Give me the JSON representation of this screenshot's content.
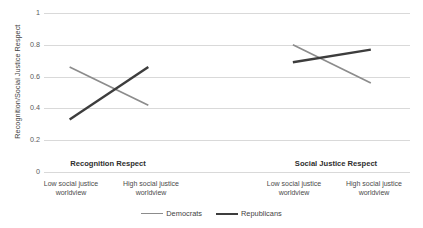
{
  "chart_data": {
    "type": "line",
    "title": "",
    "xlabel": "",
    "ylabel": "Recognition/Social Justice Respect",
    "ylim": [
      0,
      1
    ],
    "yticks": [
      "0",
      "0.2",
      "0.4",
      "0.6",
      "0.8",
      "1"
    ],
    "grid": true,
    "legend_position": "bottom",
    "groups": [
      {
        "name": "Recognition Respect",
        "categories": [
          "Low social justice worldview",
          "High social justice worldview"
        ]
      },
      {
        "name": "Social Justice Respect",
        "categories": [
          "Low social justice worldview",
          "High social justice worldview"
        ]
      }
    ],
    "categories": [
      "Low social justice worldview",
      "High social justice worldview",
      "Low social justice worldview",
      "High social justice worldview"
    ],
    "series": [
      {
        "name": "Democrats",
        "color": "#8c8c8c",
        "values": [
          0.66,
          0.42,
          0.8,
          0.56
        ]
      },
      {
        "name": "Republicans",
        "color": "#3d3d3d",
        "values": [
          0.33,
          0.66,
          0.69,
          0.77
        ]
      }
    ]
  },
  "axis": {
    "y_title": "Recognition/Social Justice Respect",
    "ticks": {
      "t1": "1",
      "t08": "0.8",
      "t06": "0.6",
      "t04": "0.4",
      "t02": "0.2",
      "t0": "0"
    }
  },
  "groups": {
    "left": {
      "title": "Recognition Respect",
      "cat1": "Low social justice\nworldview",
      "cat1_line1": "Low social justice",
      "cat1_line2": "worldview",
      "cat2_line1": "High social justice",
      "cat2_line2": "worldview"
    },
    "right": {
      "title": "Social Justice Respect",
      "cat1_line1": "Low social justice",
      "cat1_line2": "worldview",
      "cat2_line1": "High social justice",
      "cat2_line2": "worldview"
    }
  },
  "legend": {
    "democrats": "Democrats",
    "republicans": "Republicans"
  }
}
